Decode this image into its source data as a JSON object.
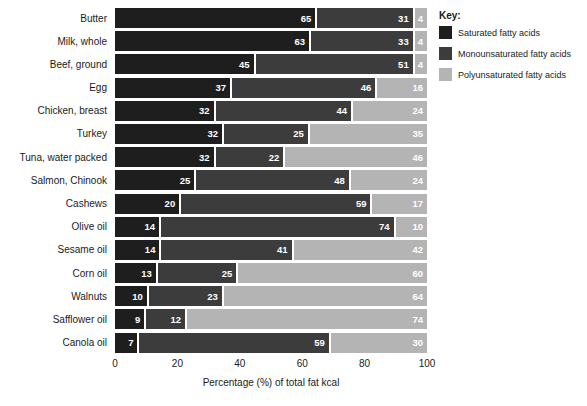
{
  "chart_data": {
    "type": "bar",
    "variant": "stacked-horizontal",
    "categories": [
      "Butter",
      "Milk, whole",
      "Beef, ground",
      "Egg",
      "Chicken, breast",
      "Turkey",
      "Tuna, water packed",
      "Salmon, Chinook",
      "Cashews",
      "Olive oil",
      "Sesame oil",
      "Corn oil",
      "Walnuts",
      "Safflower oil",
      "Canola oil"
    ],
    "series": [
      {
        "name": "Saturated fatty acids",
        "color": "#1e1e1e",
        "values": [
          65,
          63,
          45,
          37,
          32,
          32,
          32,
          25,
          20,
          14,
          14,
          13,
          10,
          9,
          7
        ]
      },
      {
        "name": "Monounsaturated fatty acids",
        "color": "#3c3c3c",
        "values": [
          31,
          33,
          51,
          46,
          44,
          25,
          22,
          48,
          59,
          74,
          41,
          25,
          23,
          12,
          59
        ]
      },
      {
        "name": "Polyunsaturated fatty acids",
        "color": "#b4b4b4",
        "values": [
          4,
          4,
          4,
          16,
          24,
          35,
          46,
          24,
          17,
          10,
          42,
          60,
          64,
          74,
          30
        ]
      }
    ],
    "xlabel": "Percentage (%) of total fat kcal",
    "x_ticks": [
      0,
      20,
      40,
      60,
      80,
      100
    ],
    "xlim": [
      0,
      100
    ],
    "grid": false,
    "legend": {
      "title": "Key:",
      "position": "top-right"
    },
    "value_label_color": "#ffffff",
    "segment_gap_color": "#ffffff"
  }
}
